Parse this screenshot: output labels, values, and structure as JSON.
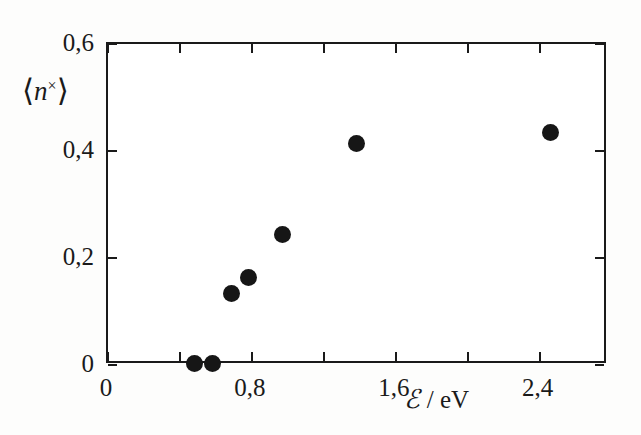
{
  "chart_data": {
    "type": "scatter",
    "title": "",
    "xlabel": "ℰ / eV",
    "ylabel": "⟨n×⟩",
    "xlim": [
      0,
      2.78
    ],
    "ylim": [
      0,
      0.6
    ],
    "grid": false,
    "legend": null,
    "decimal_separator": ",",
    "x_tick_values": [
      0,
      0.8,
      1.6,
      2.4
    ],
    "x_tick_labels": [
      "0",
      "0,8",
      "1,6",
      "2,4"
    ],
    "x_minor_tick_values": [
      0.4,
      1.2,
      2.0,
      2.8
    ],
    "y_tick_values": [
      0,
      0.2,
      0.4,
      0.6
    ],
    "y_tick_labels": [
      "0",
      "0,2",
      "0,4",
      "0,6"
    ],
    "marker": "filled-circle",
    "marker_color": "#161616",
    "points": [
      {
        "x": 0.49,
        "y": 0.0
      },
      {
        "x": 0.59,
        "y": 0.0
      },
      {
        "x": 0.7,
        "y": 0.13
      },
      {
        "x": 0.79,
        "y": 0.16
      },
      {
        "x": 0.98,
        "y": 0.24
      },
      {
        "x": 1.39,
        "y": 0.41
      },
      {
        "x": 2.47,
        "y": 0.43
      }
    ]
  },
  "axis_titles": {
    "y_angle_open": "⟨",
    "y_variable": "n",
    "y_superscript": "×",
    "y_angle_close": "⟩",
    "x_symbol": "ℰ",
    "x_units": "/ eV"
  },
  "colors": {
    "axis": "#1a1a1a",
    "marker": "#161616",
    "background": "#fdfdfc",
    "plot_background": "#ffffff"
  }
}
